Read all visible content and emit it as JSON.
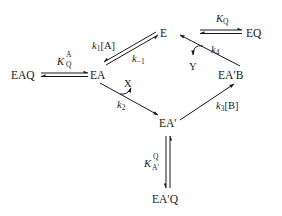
{
  "diagram": {
    "type": "enzyme-kinetic-scheme",
    "nodes": {
      "E": "E",
      "EQ": "EQ",
      "EAQ": "EAQ",
      "EA": "EA",
      "EApB": "EA′B",
      "EAp": "EA′",
      "EApQ": "EA′Q"
    },
    "edges": [
      {
        "from": "E",
        "to": "EA",
        "label": "k1[A]",
        "direction": "forward"
      },
      {
        "from": "EA",
        "to": "E",
        "label": "k-1",
        "direction": "reverse"
      },
      {
        "from": "EA",
        "to": "EA'",
        "label": "k2",
        "releases": "X"
      },
      {
        "from": "EA'",
        "to": "EA'B",
        "label": "k3[B]"
      },
      {
        "from": "EA'B",
        "to": "E",
        "label": "k4",
        "releases": "Y"
      },
      {
        "from": "E",
        "to": "EQ",
        "label": "KQ",
        "type": "equilibrium"
      },
      {
        "from": "EA",
        "to": "EAQ",
        "label": "KQ^A",
        "type": "equilibrium"
      },
      {
        "from": "EA'",
        "to": "EA'Q",
        "label": "KA'^Q",
        "type": "equilibrium"
      }
    ],
    "labels": {
      "k1": {
        "main": "k",
        "sub": "1",
        "suffix": "[A]"
      },
      "km1": {
        "main": "k",
        "sub": "−1"
      },
      "k2": {
        "main": "k",
        "sub": "2"
      },
      "k3": {
        "main": "k",
        "sub": "3",
        "suffix": "[B]"
      },
      "k4": {
        "main": "k",
        "sub": "4"
      },
      "KQ": {
        "main": "K",
        "sub": "Q"
      },
      "KQA": {
        "main": "K",
        "sup": "A",
        "sub": "Q"
      },
      "KApQ": {
        "main": "K",
        "sup": "Q",
        "sub": "A′"
      }
    },
    "products": {
      "X": "X",
      "Y": "Y"
    }
  }
}
